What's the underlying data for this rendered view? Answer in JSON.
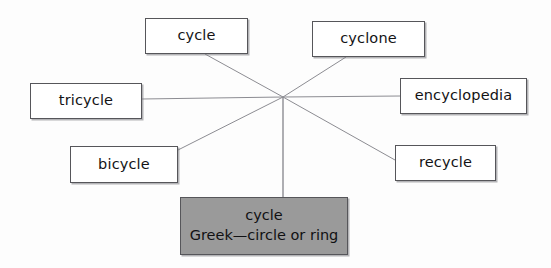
{
  "diagram": {
    "type": "word-web",
    "background_color": "#fdfdfd",
    "box_border_color": "#56565a",
    "box_fill_color": "#ffffff",
    "root_fill_color": "#9a9a9a",
    "line_color": "#8c8c92",
    "hub": {
      "x": 283,
      "y": 97
    },
    "root": {
      "line1": "cycle",
      "line2": "Greek—circle or ring",
      "x": 180,
      "y": 197,
      "w": 168,
      "h": 58
    },
    "nodes": [
      {
        "id": "cycle",
        "label": "cycle",
        "x": 145,
        "y": 18,
        "w": 103,
        "h": 36,
        "anchor_x": 205,
        "anchor_y": 54
      },
      {
        "id": "cyclone",
        "label": "cyclone",
        "x": 312,
        "y": 21,
        "w": 113,
        "h": 36,
        "anchor_x": 346,
        "anchor_y": 57
      },
      {
        "id": "tricycle",
        "label": "tricycle",
        "x": 30,
        "y": 83,
        "w": 112,
        "h": 36,
        "anchor_x": 142,
        "anchor_y": 99
      },
      {
        "id": "encyclopedia",
        "label": "encyclopedia",
        "x": 400,
        "y": 78,
        "w": 127,
        "h": 36,
        "anchor_x": 400,
        "anchor_y": 96
      },
      {
        "id": "bicycle",
        "label": "bicycle",
        "x": 70,
        "y": 146,
        "w": 108,
        "h": 37,
        "anchor_x": 178,
        "anchor_y": 150
      },
      {
        "id": "recycle",
        "label": "recycle",
        "x": 395,
        "y": 145,
        "w": 101,
        "h": 36,
        "anchor_x": 395,
        "anchor_y": 160
      }
    ]
  }
}
